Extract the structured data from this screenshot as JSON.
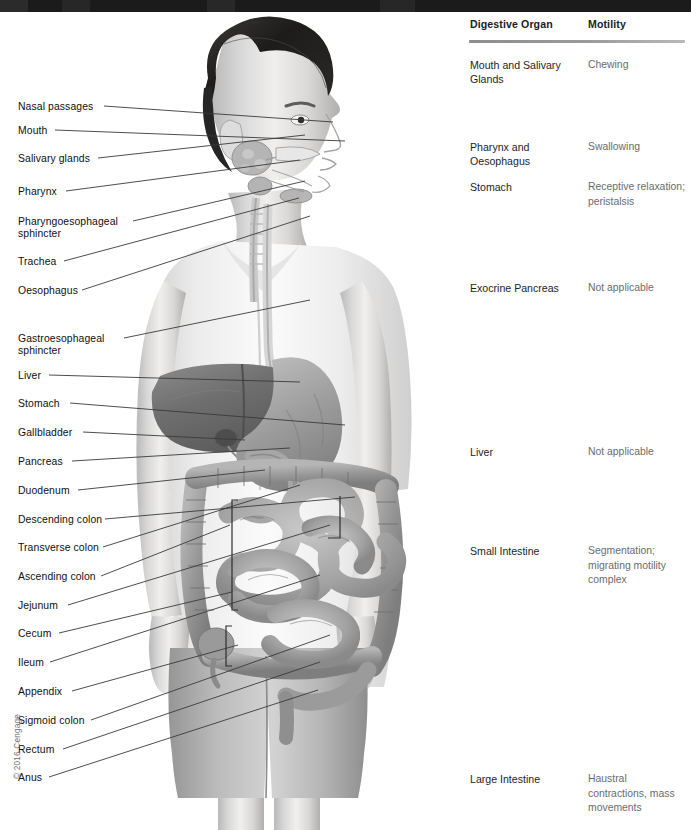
{
  "figure": {
    "copyright": "© 2016 Cengage",
    "alt_title": "Digestive system anatomy with organ motility table"
  },
  "anatomy_labels": [
    {
      "id": "nasal-passages",
      "text": "Nasal passages",
      "x": 18,
      "y": 101,
      "line": {
        "x1": 104,
        "y1": 106,
        "x2": 333,
        "y2": 122
      }
    },
    {
      "id": "mouth",
      "text": "Mouth",
      "x": 18,
      "y": 125,
      "line": {
        "x1": 55,
        "y1": 130,
        "x2": 345,
        "y2": 141
      }
    },
    {
      "id": "salivary-glands",
      "text": "Salivary glands",
      "x": 18,
      "y": 153,
      "line": {
        "x1": 98,
        "y1": 158,
        "x2": 305,
        "y2": 135
      }
    },
    {
      "id": "pharynx",
      "text": "Pharynx",
      "x": 18,
      "y": 186,
      "line": {
        "x1": 66,
        "y1": 191,
        "x2": 300,
        "y2": 160
      }
    },
    {
      "id": "pharyngoesophageal-sphincter",
      "text": "Pharyngoesophageal\nsphincter",
      "x": 18,
      "y": 216,
      "line": {
        "x1": 133,
        "y1": 221,
        "x2": 305,
        "y2": 181
      }
    },
    {
      "id": "trachea",
      "text": "Trachea",
      "x": 18,
      "y": 256,
      "line": {
        "x1": 64,
        "y1": 261,
        "x2": 299,
        "y2": 198
      }
    },
    {
      "id": "oesophagus",
      "text": "Oesophagus",
      "x": 18,
      "y": 285,
      "line": {
        "x1": 82,
        "y1": 290,
        "x2": 310,
        "y2": 216
      }
    },
    {
      "id": "gastroesophageal-sphincter",
      "text": "Gastroesophageal\nsphincter",
      "x": 18,
      "y": 333,
      "line": {
        "x1": 124,
        "y1": 338,
        "x2": 310,
        "y2": 300
      }
    },
    {
      "id": "liver",
      "text": "Liver",
      "x": 18,
      "y": 370,
      "line": {
        "x1": 49,
        "y1": 375,
        "x2": 300,
        "y2": 382
      }
    },
    {
      "id": "stomach",
      "text": "Stomach",
      "x": 18,
      "y": 398,
      "line": {
        "x1": 70,
        "y1": 403,
        "x2": 345,
        "y2": 425
      }
    },
    {
      "id": "gallbladder",
      "text": "Gallbladder",
      "x": 18,
      "y": 427,
      "line": {
        "x1": 83,
        "y1": 432,
        "x2": 245,
        "y2": 440
      }
    },
    {
      "id": "pancreas",
      "text": "Pancreas",
      "x": 18,
      "y": 456,
      "line": {
        "x1": 72,
        "y1": 461,
        "x2": 290,
        "y2": 448
      }
    },
    {
      "id": "duodenum",
      "text": "Duodenum",
      "x": 18,
      "y": 485,
      "line": {
        "x1": 78,
        "y1": 490,
        "x2": 265,
        "y2": 470
      }
    },
    {
      "id": "descending-colon",
      "text": "Descending colon",
      "x": 18,
      "y": 514,
      "line": {
        "x1": 105,
        "y1": 519,
        "x2": 355,
        "y2": 497
      }
    },
    {
      "id": "transverse-colon",
      "text": "Transverse colon",
      "x": 18,
      "y": 542,
      "line": {
        "x1": 103,
        "y1": 547,
        "x2": 300,
        "y2": 485
      }
    },
    {
      "id": "ascending-colon",
      "text": "Ascending colon",
      "x": 18,
      "y": 571,
      "line": {
        "x1": 101,
        "y1": 576,
        "x2": 230,
        "y2": 525
      }
    },
    {
      "id": "jejunum",
      "text": "Jejunum",
      "x": 18,
      "y": 600,
      "line": {
        "x1": 68,
        "y1": 605,
        "x2": 330,
        "y2": 525
      }
    },
    {
      "id": "cecum",
      "text": "Cecum",
      "x": 18,
      "y": 628,
      "line": {
        "x1": 59,
        "y1": 633,
        "x2": 232,
        "y2": 592
      }
    },
    {
      "id": "ileum",
      "text": "Ileum",
      "x": 18,
      "y": 657,
      "line": {
        "x1": 50,
        "y1": 662,
        "x2": 320,
        "y2": 575
      }
    },
    {
      "id": "appendix",
      "text": "Appendix",
      "x": 18,
      "y": 686,
      "line": {
        "x1": 72,
        "y1": 691,
        "x2": 238,
        "y2": 645
      }
    },
    {
      "id": "sigmoid-colon",
      "text": "Sigmoid colon",
      "x": 18,
      "y": 715,
      "line": {
        "x1": 91,
        "y1": 720,
        "x2": 330,
        "y2": 635
      }
    },
    {
      "id": "rectum",
      "text": "Rectum",
      "x": 18,
      "y": 744,
      "line": {
        "x1": 63,
        "y1": 749,
        "x2": 320,
        "y2": 662
      }
    },
    {
      "id": "anus",
      "text": "Anus",
      "x": 18,
      "y": 772,
      "line": {
        "x1": 49,
        "y1": 777,
        "x2": 318,
        "y2": 690
      }
    }
  ],
  "table": {
    "headers": {
      "organ": "Digestive Organ",
      "motility": "Motility"
    },
    "rows": [
      {
        "id": "mouth-salivary-glands",
        "organ": "Mouth and Salivary Glands",
        "motility": "Chewing",
        "top": 40
      },
      {
        "id": "pharynx-oesophagus",
        "organ": "Pharynx and Oesophagus",
        "motility": "Swallowing",
        "top": 122
      },
      {
        "id": "stomach",
        "organ": "Stomach",
        "motility": "Receptive relaxation; peristalsis",
        "top": 162
      },
      {
        "id": "exocrine-pancreas",
        "organ": "Exocrine Pancreas",
        "motility": "Not applicable",
        "top": 263
      },
      {
        "id": "liver",
        "organ": "Liver",
        "motility": "Not applicable",
        "top": 427
      },
      {
        "id": "small-intestine",
        "organ": "Small Intestine",
        "motility": "Segmentation; migrating motility complex",
        "top": 526
      },
      {
        "id": "large-intestine",
        "organ": "Large Intestine",
        "motility": "Haustral contractions, mass movements",
        "top": 754
      }
    ]
  },
  "colors": {
    "top_band": "#1b1b1b",
    "header_text": "#1d1d1d",
    "organ_text": "#1e1e1e",
    "motility_text": "#6b6b6b",
    "rule": "#8d8d8d",
    "label_text": "#111111",
    "leader_line": "#3a3a3a",
    "copyright_text": "#6f6f6f"
  }
}
